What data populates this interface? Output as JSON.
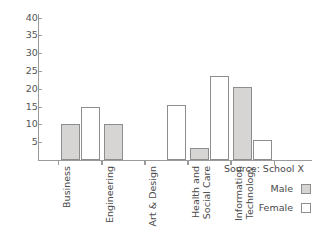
{
  "chart_data": {
    "type": "bar",
    "title": "",
    "subtitle": "",
    "xlabel": "",
    "ylabel": "",
    "ylim": [
      0,
      41
    ],
    "yticks": [
      5,
      10,
      15,
      20,
      25,
      30,
      35,
      40
    ],
    "ytick_labels": [
      "5",
      "10",
      "15",
      "20",
      "25",
      "30",
      "35",
      "40"
    ],
    "grid": false,
    "legend_position": "bottom-right",
    "categories": [
      "Business",
      "Engineering",
      "Art & Design",
      "Health and Social Care",
      "Information Technology"
    ],
    "category_lines": [
      [
        "Business"
      ],
      [
        "Engineering"
      ],
      [
        "Art & Design"
      ],
      [
        "Health and",
        "Social Care"
      ],
      [
        "Information",
        "Technology"
      ]
    ],
    "series": [
      {
        "name": "Male",
        "color": "#d6d5d3",
        "values": [
          10,
          10,
          0,
          3.5,
          20.5
        ]
      },
      {
        "name": "Female",
        "color": "#ffffff",
        "values": [
          15,
          0,
          15.5,
          23.5,
          5.5
        ]
      }
    ],
    "annotations": [
      "Source: School X"
    ]
  },
  "legend": {
    "source": "Source: School X",
    "entries": [
      {
        "label": "Male",
        "swatch": "male"
      },
      {
        "label": "Female",
        "swatch": "female"
      }
    ]
  },
  "colors": {
    "male_fill": "#d6d5d3",
    "female_fill": "#ffffff",
    "bar_stroke": "#8d8d8d",
    "axis": "#9a9a9a",
    "text": "#4a4a4a"
  }
}
